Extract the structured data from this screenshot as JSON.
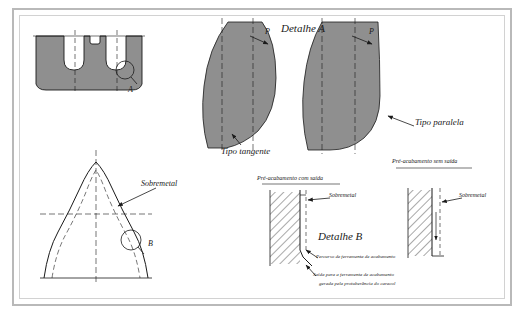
{
  "figure": {
    "background_color": "#ffffff",
    "frame_color": "#b9b9b9",
    "blade_fill": "#8c8c8c",
    "line_color": "#1a1a1a"
  },
  "labels": {
    "detalhe_a": "Detalhe A",
    "detalhe_b": "Detalhe B",
    "tipo_tangente": "Tipo tangente",
    "tipo_paralela": "Tipo paralela",
    "sobremetal_left": "Sobremetal",
    "sobremetal_mid": "Sobremetal",
    "sobremetal_right": "Sobremetal",
    "pre_acabamento_com_saida": "Pré-acabamento com saída",
    "pre_acabamento_sem_saida": "Pré-acabamento sem saída",
    "percurso_ferramenta": "Percurso de ferramenta de acabamento",
    "saida_ferramenta_1": "Saída para a ferramenta de acabamento",
    "saida_ferramenta_2": "gerada pela protuberância do caracol",
    "callout_a": "A",
    "callout_b": "B",
    "callout_p_left": "P",
    "callout_p_right": "P"
  },
  "panels": [
    {
      "id": "tooth-profile",
      "name": "Perfil de dentes com protuberância"
    },
    {
      "id": "blade-tangente",
      "name": "Lâmina tipo tangente"
    },
    {
      "id": "blade-paralela",
      "name": "Lâmina tipo paralela"
    },
    {
      "id": "gear-tooth-section",
      "name": "Seção do dente com sobremetal"
    },
    {
      "id": "detail-b-with-exit",
      "name": "Pré-acabamento com saída"
    },
    {
      "id": "detail-b-without-exit",
      "name": "Pré-acabamento sem saída"
    }
  ]
}
